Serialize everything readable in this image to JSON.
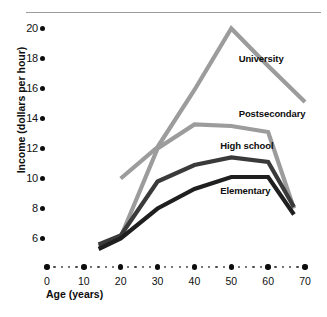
{
  "chart_data": {
    "type": "line",
    "title": "",
    "xlabel": "Age (years)",
    "ylabel": "Income (dollars per hour)",
    "xlim": [
      0,
      70
    ],
    "ylim": [
      5,
      20.6
    ],
    "xticks": [
      0,
      10,
      20,
      30,
      40,
      50,
      60,
      70
    ],
    "xtick_labels": [
      "0",
      "10",
      "20",
      "30",
      "40",
      "50",
      "60",
      "70"
    ],
    "yticks": [
      6,
      8,
      10,
      12,
      14,
      16,
      18,
      20
    ],
    "ytick_labels": [
      "6",
      "8",
      "10",
      "12",
      "14",
      "16",
      "18",
      "20"
    ],
    "grid": false,
    "legend_position": "inline-annotations",
    "x": [
      14,
      20,
      30,
      40,
      50,
      60,
      67
    ],
    "series": [
      {
        "name": "University",
        "label": "University",
        "color": "#9c9c9c",
        "x": [
          20,
          30,
          40,
          50,
          60,
          70
        ],
        "values": [
          10.0,
          12.1,
          15.9,
          20.0,
          17.5,
          15.1
        ]
      },
      {
        "name": "Postsecondary",
        "label": "Postsecondary",
        "color": "#9c9c9c",
        "x": [
          14,
          20,
          30,
          40,
          50,
          60,
          67
        ],
        "values": [
          5.5,
          6.1,
          12.0,
          13.6,
          13.5,
          13.1,
          8.0
        ]
      },
      {
        "name": "High school",
        "label": "High school",
        "color": "#3a3a3a",
        "x": [
          14,
          20,
          30,
          40,
          50,
          60,
          67
        ],
        "values": [
          5.6,
          6.2,
          9.8,
          10.9,
          11.4,
          11.1,
          8.1
        ]
      },
      {
        "name": "Elementary",
        "label": "Elementary",
        "color": "#1f1f1f",
        "x": [
          14,
          20,
          30,
          40,
          50,
          60,
          67
        ],
        "values": [
          5.3,
          6.0,
          8.0,
          9.3,
          10.1,
          10.1,
          7.6
        ]
      }
    ],
    "annotations": [
      {
        "text": "University",
        "x": 52,
        "y": 18.0
      },
      {
        "text": "Postsecondary",
        "x": 52,
        "y": 14.3
      },
      {
        "text": "High school",
        "x": 47,
        "y": 12.2
      },
      {
        "text": "Elementary",
        "x": 47,
        "y": 9.2
      }
    ]
  },
  "axis": {
    "y_label": "Income (dollars per hour)",
    "x_label": "Age (years)",
    "y_tick_labels": [
      "20",
      "18",
      "16",
      "14",
      "12",
      "10",
      "8",
      "6"
    ],
    "x_tick_labels": [
      "0",
      "10",
      "20",
      "30",
      "40",
      "50",
      "60",
      "70"
    ]
  },
  "series_labels": {
    "university": "University",
    "postsecondary": "Postsecondary",
    "high_school": "High school",
    "elementary": "Elementary"
  },
  "colors": {
    "light_gray_line": "#9c9c9c",
    "dark_gray_line": "#3a3a3a",
    "black_line": "#1f1f1f",
    "axis_dot": "#0d0d0d",
    "top_rule": "#9c9c9c",
    "text": "#0d0d0d",
    "background": "#ffffff"
  }
}
